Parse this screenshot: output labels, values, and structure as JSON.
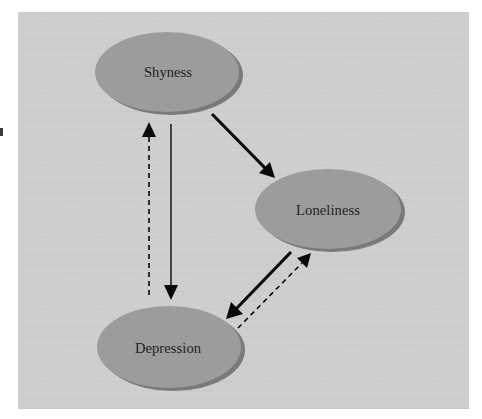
{
  "figure": {
    "nodes": [
      {
        "id": "shyness",
        "label": "Shyness"
      },
      {
        "id": "loneliness",
        "label": "Loneliness"
      },
      {
        "id": "depression",
        "label": "Depression"
      }
    ],
    "edges": [
      {
        "from": "Shyness",
        "to": "Loneliness",
        "style": "solid-thick"
      },
      {
        "from": "Shyness",
        "to": "Depression",
        "style": "solid-thin"
      },
      {
        "from": "Depression",
        "to": "Shyness",
        "style": "dashed"
      },
      {
        "from": "Loneliness",
        "to": "Depression",
        "style": "solid-thick"
      },
      {
        "from": "Depression",
        "to": "Loneliness",
        "style": "dashed"
      }
    ],
    "colors": {
      "panel_background": "#cecece",
      "node_fill": "#9c9c9c",
      "node_shadow": "#7a7a7a",
      "arrow": "#0a0a0a",
      "label_text": "#1e1e1e"
    }
  }
}
